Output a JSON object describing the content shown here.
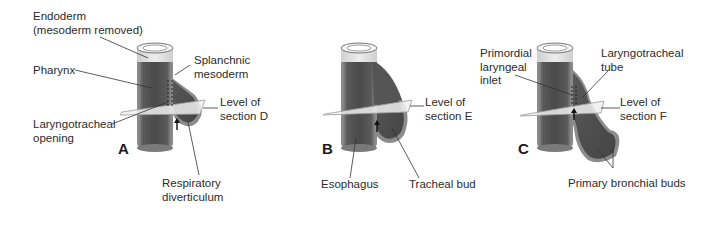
{
  "figure": {
    "panels": [
      {
        "id": "A",
        "letter": "A",
        "labels": {
          "endoderm_line1": "Endoderm",
          "endoderm_line2": "(mesoderm removed)",
          "pharynx": "Pharynx",
          "splanchnic_line1": "Splanchnic",
          "splanchnic_line2": "mesoderm",
          "level_line1": "Level of",
          "level_line2": "section D",
          "opening_line1": "Laryngotracheal",
          "opening_line2": "opening",
          "diverticulum_line1": "Respiratory",
          "diverticulum_line2": "diverticulum"
        }
      },
      {
        "id": "B",
        "letter": "B",
        "labels": {
          "level_line1": "Level of",
          "level_line2": "section E",
          "esophagus": "Esophagus",
          "tracheal_bud": "Tracheal bud"
        }
      },
      {
        "id": "C",
        "letter": "C",
        "labels": {
          "inlet_line1": "Primordial",
          "inlet_line2": "laryngeal",
          "inlet_line3": "inlet",
          "tube_line1": "Laryngotracheal",
          "tube_line2": "tube",
          "level_line1": "Level of",
          "level_line2": "section F",
          "bronchial_buds": "Primary bronchial buds"
        }
      }
    ],
    "colors": {
      "tube_dark": "#4f4f4f",
      "tube_mid": "#6b6b6b",
      "tube_rim": "#8c8c8c",
      "cap_light": "#e6e6e6",
      "plane": "#f0f0f0",
      "plane_stroke": "#9a9a9a",
      "leader": "#333333"
    }
  }
}
